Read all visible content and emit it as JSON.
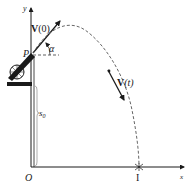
{
  "diagram": {
    "title": "",
    "type": "projectile-motion",
    "labels": {
      "y_axis": "y",
      "x_axis": "x",
      "origin": "O",
      "launch_point": "P",
      "initial_velocity_bold": "V",
      "initial_velocity_arg": "(0)",
      "angle": "α",
      "velocity_t_bold": "V",
      "velocity_t_arg": "(t)",
      "height_main": "s",
      "height_sub": "0",
      "impact": "I"
    },
    "colors": {
      "ink": "#1a1a1a",
      "trajectory": "#555555",
      "background": "#ffffff"
    },
    "elements": [
      "coordinate axes with origin O",
      "cannon on platform at height s0",
      "launch point P",
      "initial velocity vector V(0) at angle alpha",
      "dashed parabolic trajectory",
      "velocity vector V(t) along trajectory",
      "impact point I on x-axis"
    ]
  }
}
